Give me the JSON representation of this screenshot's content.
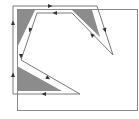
{
  "diagram": {
    "width": 139,
    "height": 119,
    "colors": {
      "background": "#ffffff",
      "box_stroke": "#8a8a8a",
      "path_stroke": "#7a7a7a",
      "fill": "#8c8c8c",
      "arrow": "#333333"
    },
    "box": {
      "x": 17,
      "y": 9,
      "w": 120,
      "h": 101
    },
    "shaded_regions": [
      {
        "name": "top-left-triangle",
        "points": "17,10 35,10 17,48"
      },
      {
        "name": "top-right-triangle",
        "points": "72,10 92,10 100,37"
      },
      {
        "name": "bottom-left-triangle",
        "points": "17,66 17,91 62,91"
      }
    ],
    "path": {
      "points": "13,94 13,6 97,6 113,55 72,13 37,13 21,60 80,94 13,94"
    },
    "arrows": [
      {
        "x": 50,
        "y": 6,
        "angle": 0
      },
      {
        "x": 105,
        "y": 30,
        "angle": 72
      },
      {
        "x": 92,
        "y": 35,
        "angle": 225
      },
      {
        "x": 55,
        "y": 13,
        "angle": 180
      },
      {
        "x": 30,
        "y": 30,
        "angle": 109
      },
      {
        "x": 21,
        "y": 56,
        "angle": 90
      },
      {
        "x": 48,
        "y": 78,
        "angle": 30
      },
      {
        "x": 44,
        "y": 94,
        "angle": 180
      },
      {
        "x": 13,
        "y": 75,
        "angle": 270
      },
      {
        "x": 13,
        "y": 23,
        "angle": 270
      }
    ]
  }
}
